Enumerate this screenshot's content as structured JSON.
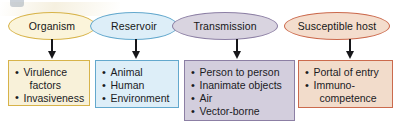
{
  "figure": {
    "nodes": [
      {
        "id": "organism",
        "label": "Organism",
        "accent": "#d7b349",
        "fill": "#fbf4da",
        "arrow_icon": "down-arrow-icon",
        "items": [
          {
            "text": "Virulence",
            "continuation": "factors"
          },
          {
            "text": "Invasiveness",
            "continuation": ""
          }
        ]
      },
      {
        "id": "reservoir",
        "label": "Reservoir",
        "accent": "#63a8cd",
        "fill": "#ddeef8",
        "arrow_icon": "down-arrow-icon",
        "items": [
          {
            "text": "Animal",
            "continuation": ""
          },
          {
            "text": "Human",
            "continuation": ""
          },
          {
            "text": "Environment",
            "continuation": ""
          }
        ]
      },
      {
        "id": "transmission",
        "label": "Transmission",
        "accent": "#8c7fa4",
        "fill": "#d9d4e0",
        "arrow_icon": "down-arrow-icon",
        "items": [
          {
            "text": "Person to person",
            "continuation": ""
          },
          {
            "text": "Inanimate objects",
            "continuation": ""
          },
          {
            "text": "Air",
            "continuation": ""
          },
          {
            "text": "Vector-borne",
            "continuation": ""
          }
        ]
      },
      {
        "id": "host",
        "label": "Susceptible host",
        "accent": "#cb6a4d",
        "fill": "#f4ddcd",
        "arrow_icon": "down-arrow-icon",
        "items": [
          {
            "text": "Portal of entry",
            "continuation": ""
          },
          {
            "text": "Immuno-",
            "continuation": "competence"
          }
        ]
      }
    ]
  }
}
